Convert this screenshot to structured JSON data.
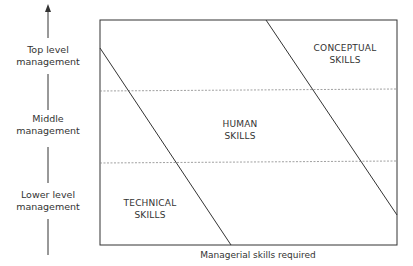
{
  "diagram": {
    "y_axis": {
      "levels": [
        {
          "line1": "Top level",
          "line2": "management"
        },
        {
          "line1": "Middle",
          "line2": "management"
        },
        {
          "line1": "Lower level",
          "line2": "management"
        }
      ],
      "arrow": "up-arrow"
    },
    "x_axis": {
      "label": "Managerial skills required"
    },
    "regions": [
      {
        "line1": "CONCEPTUAL",
        "line2": "SKILLS"
      },
      {
        "line1": "HUMAN",
        "line2": "SKILLS"
      },
      {
        "line1": "TECHNICAL",
        "line2": "SKILLS"
      }
    ],
    "colors": {
      "line": "#333333",
      "dashed": "#888888",
      "background": "#ffffff"
    }
  }
}
